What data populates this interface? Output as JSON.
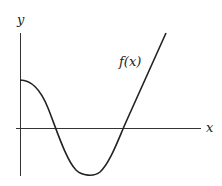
{
  "diagram": {
    "title": "",
    "axes": {
      "x_label": "x",
      "y_label": "y"
    },
    "curve": {
      "label": "f(x)",
      "description": "Starts at positive y-intercept, decreases through a root, reaches a minimum below the x-axis, rises through a second root, then continues upward as a straight line"
    },
    "colors": {
      "stroke": "#222222",
      "background": "#ffffff"
    }
  }
}
